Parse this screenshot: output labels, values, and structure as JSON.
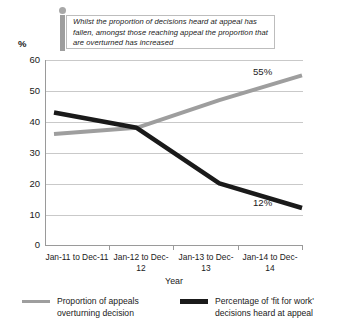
{
  "callout": {
    "text": "Whilst the proportion of decisions heard at appeal has fallen, amongst those reaching appeal the proportion that are overturned has increased",
    "accent_color": "#9e9e9e",
    "border_color": "#bdbdbd"
  },
  "chart_data": {
    "type": "line",
    "title": "",
    "xlabel": "Year",
    "ylabel": "%",
    "ylim": [
      0,
      60
    ],
    "yticks": [
      0,
      10,
      20,
      30,
      40,
      50,
      60
    ],
    "grid": true,
    "legend_position": "bottom",
    "categories": [
      "Jan-11 to Dec-11",
      "Jan-12 to Dec-12",
      "Jan-13 to Dec-13",
      "Jan-14 to Dec-14"
    ],
    "series": [
      {
        "name": "Proportion of appeals overturning decision",
        "color": "#9e9e9e",
        "values": [
          36,
          38,
          47,
          55
        ],
        "end_label": "55%"
      },
      {
        "name": "Percentage of 'fit for work' decisions heard at appeal",
        "color": "#1a1a1a",
        "values": [
          43,
          38,
          20,
          12
        ],
        "end_label": "12%"
      }
    ]
  },
  "axis": {
    "y_unit": "%",
    "ytick_labels": [
      "0",
      "10",
      "20",
      "30",
      "40",
      "50",
      "60"
    ],
    "xtick_labels": [
      "Jan-11 to Dec-11",
      "Jan-12 to Dec-12",
      "Jan-13 to Dec-13",
      "Jan-14 to Dec-14"
    ],
    "x_title": "Year"
  },
  "legend": {
    "items": [
      {
        "label": "Proportion of appeals overturning decision",
        "color": "#9e9e9e"
      },
      {
        "label": "Percentage of 'fit for work' decisions heard at appeal",
        "color": "#1a1a1a"
      }
    ]
  }
}
